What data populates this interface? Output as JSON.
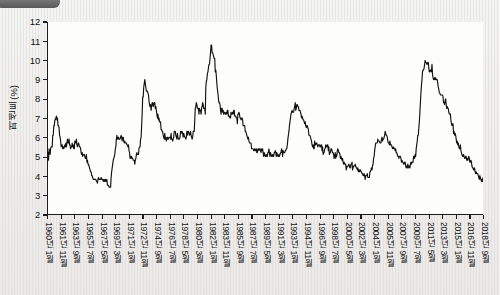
{
  "chart_data": {
    "type": "line",
    "title": "",
    "xlabel": "",
    "ylabel": "퍼센트(%)",
    "ylim": [
      2,
      12
    ],
    "yticks": [
      2,
      3,
      4,
      5,
      6,
      7,
      8,
      9,
      10,
      11,
      12
    ],
    "grid": false,
    "legend": null,
    "xtick_labels": [
      "1960년 1월",
      "1961년 11월",
      "1963년 9월",
      "1965년 7월",
      "1967년 5월",
      "1969년 3월",
      "1971년 1월",
      "1972년 11월",
      "1974년 9월",
      "1976년 7월",
      "1978년 5월",
      "1980년 3월",
      "1982년 1월",
      "1983년 11월",
      "1985년 9월",
      "1987년 7월",
      "1989년 5월",
      "1991년 3월",
      "1993년 1월",
      "1994년 11월",
      "1996년 9월",
      "1998년 7월",
      "2000년 5월",
      "2002년 3월",
      "2004년 1월",
      "2005년 11월",
      "2007년 9월",
      "2009년 7월",
      "2011년 5월",
      "2013년 3월",
      "2015년 1월",
      "2016년 11월",
      "2018년 9월"
    ],
    "x_start": "1960-01",
    "x_end": "2018-12",
    "x_step_months": 1,
    "series": [
      {
        "name": "실업률",
        "color": "#111111",
        "values": [
          5.2,
          4.8,
          5.4,
          5.2,
          5.1,
          5.4,
          5.5,
          5.5,
          5.5,
          6.1,
          6.1,
          6.6,
          6.6,
          6.9,
          6.9,
          7.0,
          7.1,
          6.9,
          7.0,
          6.6,
          6.6,
          6.5,
          6.1,
          6.0,
          5.8,
          5.5,
          5.6,
          5.6,
          5.4,
          5.5,
          5.4,
          5.5,
          5.6,
          5.5,
          5.7,
          5.5,
          5.7,
          5.9,
          5.7,
          5.7,
          5.9,
          5.6,
          5.6,
          5.4,
          5.5,
          5.5,
          5.7,
          5.5,
          5.6,
          5.4,
          5.4,
          5.8,
          5.7,
          5.7,
          5.9,
          5.6,
          5.5,
          5.6,
          5.7,
          5.6,
          5.5,
          5.5,
          5.4,
          5.2,
          5.1,
          5.2,
          5.0,
          5.1,
          5.1,
          5.1,
          5.0,
          4.9,
          4.9,
          5.1,
          4.7,
          4.8,
          4.6,
          4.6,
          4.5,
          4.4,
          4.3,
          4.2,
          4.2,
          4.0,
          4.0,
          3.9,
          3.8,
          3.8,
          3.8,
          3.8,
          3.8,
          3.8,
          3.7,
          3.7,
          3.6,
          3.8,
          3.9,
          3.8,
          3.8,
          3.8,
          3.8,
          3.9,
          3.8,
          3.8,
          3.8,
          3.7,
          3.8,
          3.7,
          3.8,
          3.7,
          3.8,
          3.7,
          3.8,
          3.5,
          3.5,
          3.5,
          3.4,
          3.4,
          3.4,
          3.4,
          3.9,
          4.2,
          4.4,
          4.6,
          4.8,
          4.9,
          5.0,
          5.1,
          5.4,
          5.5,
          5.9,
          6.1,
          5.9,
          5.9,
          6.0,
          5.9,
          5.9,
          5.9,
          6.0,
          6.1,
          6.0,
          5.8,
          6.0,
          6.0,
          5.8,
          5.7,
          5.8,
          5.7,
          5.7,
          5.7,
          5.6,
          5.6,
          5.5,
          5.6,
          5.3,
          5.2,
          4.9,
          5.0,
          4.9,
          5.0,
          4.9,
          4.9,
          4.8,
          4.8,
          4.8,
          4.6,
          4.8,
          4.9,
          5.1,
          5.2,
          5.1,
          5.1,
          5.1,
          5.4,
          5.5,
          5.5,
          5.9,
          6.0,
          6.6,
          7.2,
          8.1,
          8.1,
          8.6,
          8.8,
          9.0,
          8.8,
          8.6,
          8.4,
          8.4,
          8.4,
          8.3,
          8.2,
          7.9,
          7.7,
          7.6,
          7.7,
          7.4,
          7.6,
          7.8,
          7.8,
          7.6,
          7.7,
          7.8,
          7.8,
          7.5,
          7.6,
          7.4,
          7.2,
          7.0,
          7.2,
          6.9,
          7.0,
          6.8,
          6.8,
          6.8,
          6.4,
          6.4,
          6.3,
          6.3,
          6.1,
          6.0,
          5.9,
          6.2,
          5.9,
          6.0,
          5.8,
          5.9,
          6.0,
          5.9,
          5.9,
          6.0,
          6.0,
          6.0,
          5.9,
          6.2,
          5.9,
          5.9,
          5.8,
          5.9,
          6.0,
          6.3,
          6.3,
          6.3,
          6.1,
          6.0,
          5.9,
          6.2,
          6.0,
          5.9,
          5.9,
          5.9,
          6.0,
          6.3,
          6.2,
          6.3,
          6.3,
          6.2,
          6.0,
          6.2,
          6.1,
          6.0,
          6.0,
          5.9,
          6.0,
          6.3,
          6.1,
          6.3,
          6.3,
          6.2,
          6.1,
          6.2,
          6.3,
          6.1,
          6.0,
          5.9,
          6.0,
          6.3,
          6.3,
          6.3,
          6.9,
          7.5,
          7.6,
          7.8,
          7.7,
          7.5,
          7.5,
          7.5,
          7.2,
          7.5,
          7.4,
          7.4,
          7.2,
          7.5,
          7.6,
          7.8,
          7.7,
          7.5,
          7.5,
          7.5,
          7.2,
          8.6,
          8.9,
          9.0,
          9.3,
          9.4,
          9.6,
          9.8,
          9.8,
          10.1,
          10.4,
          10.8,
          10.8,
          10.4,
          10.4,
          10.3,
          10.2,
          10.1,
          10.1,
          9.4,
          9.5,
          9.2,
          8.8,
          8.5,
          8.3,
          8.0,
          7.8,
          7.8,
          7.7,
          7.4,
          7.2,
          7.5,
          7.5,
          7.3,
          7.4,
          7.2,
          7.3,
          7.3,
          7.2,
          7.2,
          7.3,
          7.2,
          7.4,
          7.4,
          7.1,
          7.1,
          7.1,
          7.0,
          7.0,
          7.3,
          7.2,
          7.2,
          7.3,
          7.2,
          7.4,
          7.4,
          7.1,
          7.1,
          7.1,
          7.0,
          7.0,
          6.7,
          7.2,
          7.2,
          7.3,
          7.2,
          7.0,
          7.0,
          6.9,
          7.0,
          7.0,
          6.9,
          6.6,
          6.6,
          6.6,
          6.6,
          6.3,
          6.3,
          6.2,
          6.1,
          6.0,
          5.9,
          6.0,
          5.8,
          5.7,
          5.7,
          5.7,
          5.7,
          5.4,
          5.4,
          5.4,
          5.4,
          5.3,
          5.3,
          5.4,
          5.3,
          5.3,
          5.4,
          5.2,
          5.2,
          5.4,
          5.4,
          5.3,
          5.4,
          5.4,
          5.3,
          5.2,
          5.4,
          5.3,
          5.4,
          5.2,
          5.0,
          5.2,
          5.1,
          5.0,
          5.0,
          5.1,
          5.0,
          5.0,
          5.2,
          5.2,
          5.4,
          5.2,
          5.0,
          5.2,
          5.1,
          5.0,
          5.0,
          5.1,
          5.0,
          5.0,
          5.2,
          5.2,
          5.3,
          5.2,
          5.0,
          5.2,
          5.1,
          5.0,
          5.0,
          5.1,
          5.0,
          5.1,
          5.2,
          5.2,
          5.4,
          5.3,
          5.0,
          5.3,
          5.2,
          5.2,
          5.2,
          5.3,
          5.3,
          5.4,
          5.4,
          5.6,
          5.9,
          6.1,
          6.3,
          6.6,
          6.8,
          7.0,
          7.2,
          7.3,
          7.4,
          7.3,
          7.3,
          7.3,
          7.5,
          7.6,
          7.8,
          7.4,
          7.5,
          7.7,
          7.7,
          7.6,
          7.6,
          7.4,
          7.4,
          7.4,
          7.3,
          7.2,
          7.0,
          7.1,
          7.0,
          6.9,
          6.9,
          6.8,
          6.7,
          6.8,
          6.6,
          6.5,
          6.6,
          6.6,
          6.5,
          6.4,
          6.1,
          6.1,
          6.1,
          6.0,
          5.9,
          5.8,
          5.6,
          5.5,
          5.6,
          5.4,
          5.4,
          5.8,
          5.6,
          5.6,
          5.7,
          5.7,
          5.6,
          5.5,
          5.6,
          5.6,
          5.6,
          5.5,
          5.5,
          5.6,
          5.6,
          5.3,
          5.5,
          5.1,
          5.2,
          5.2,
          5.4,
          5.4,
          5.6,
          5.5,
          5.5,
          5.6,
          5.6,
          5.3,
          5.5,
          5.1,
          5.2,
          5.2,
          5.4,
          5.4,
          5.3,
          5.2,
          5.2,
          5.1,
          4.9,
          5.0,
          5.2,
          4.9,
          5.1,
          5.0,
          5.3,
          5.4,
          5.3,
          5.2,
          5.2,
          5.1,
          4.9,
          5.0,
          4.9,
          4.8,
          4.9,
          4.7,
          4.6,
          4.7,
          4.6,
          4.6,
          4.6,
          4.3,
          4.4,
          4.5,
          4.5,
          4.5,
          4.6,
          4.5,
          4.4,
          4.4,
          4.6,
          4.6,
          4.7,
          4.3,
          4.4,
          4.5,
          4.5,
          4.5,
          4.6,
          4.5,
          4.4,
          4.4,
          4.3,
          4.4,
          4.2,
          4.3,
          4.2,
          4.3,
          4.3,
          4.2,
          4.2,
          4.1,
          4.1,
          4.0,
          4.0,
          4.1,
          4.0,
          3.8,
          4.0,
          4.0,
          4.0,
          4.1,
          3.9,
          3.9,
          3.9,
          3.9,
          4.2,
          4.2,
          4.3,
          4.4,
          4.3,
          4.5,
          4.6,
          4.9,
          5.0,
          5.3,
          5.5,
          5.7,
          5.7,
          5.7,
          5.7,
          5.9,
          5.8,
          5.8,
          5.8,
          5.7,
          5.7,
          5.7,
          5.9,
          6.0,
          5.8,
          5.9,
          5.9,
          6.0,
          6.1,
          6.3,
          6.2,
          6.1,
          6.1,
          6.0,
          5.8,
          5.7,
          5.7,
          5.6,
          5.8,
          5.6,
          5.6,
          5.6,
          5.5,
          5.4,
          5.4,
          5.5,
          5.4,
          5.4,
          5.3,
          5.4,
          5.2,
          5.2,
          5.1,
          5.0,
          5.0,
          4.9,
          5.0,
          5.0,
          5.0,
          4.9,
          4.7,
          4.8,
          4.7,
          4.7,
          4.6,
          4.6,
          4.7,
          4.7,
          4.5,
          4.4,
          4.5,
          4.4,
          4.6,
          4.5,
          4.4,
          4.5,
          4.4,
          4.6,
          4.7,
          4.6,
          4.7,
          4.7,
          4.7,
          5.0,
          5.0,
          4.9,
          5.1,
          5.0,
          5.4,
          5.6,
          5.8,
          6.1,
          6.1,
          6.5,
          6.8,
          7.3,
          7.8,
          8.3,
          8.7,
          9.0,
          9.4,
          9.5,
          9.5,
          9.6,
          9.8,
          10.0,
          9.9,
          9.9,
          9.8,
          9.8,
          9.9,
          9.9,
          9.6,
          9.4,
          9.4,
          9.5,
          9.5,
          9.4,
          9.8,
          9.3,
          9.1,
          9.0,
          9.0,
          9.1,
          9.0,
          9.1,
          9.0,
          9.0,
          9.0,
          8.8,
          8.6,
          8.5,
          8.3,
          8.3,
          8.2,
          8.2,
          8.2,
          8.2,
          8.2,
          8.1,
          7.8,
          7.8,
          7.7,
          7.9,
          8.0,
          7.7,
          7.5,
          7.6,
          7.5,
          7.5,
          7.3,
          7.2,
          7.2,
          7.2,
          6.9,
          6.7,
          6.6,
          6.7,
          6.7,
          6.2,
          6.3,
          6.1,
          6.2,
          6.1,
          5.9,
          5.7,
          5.8,
          5.6,
          5.7,
          5.5,
          5.4,
          5.4,
          5.6,
          5.3,
          5.2,
          5.1,
          5.0,
          5.0,
          5.1,
          5.0,
          4.9,
          4.9,
          5.0,
          5.0,
          4.8,
          4.9,
          4.8,
          4.9,
          5.0,
          4.9,
          4.7,
          4.7,
          4.8,
          4.7,
          4.5,
          4.4,
          4.4,
          4.3,
          4.3,
          4.4,
          4.2,
          4.1,
          4.2,
          4.1,
          4.1,
          4.1,
          4.0,
          3.9,
          3.8,
          4.0,
          3.9,
          3.8,
          3.7,
          3.8,
          3.7,
          3.9
        ]
      }
    ]
  }
}
